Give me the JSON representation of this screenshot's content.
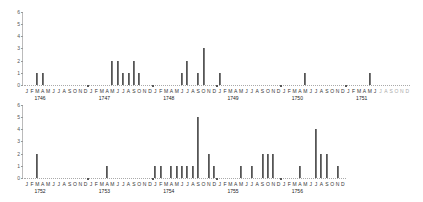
{
  "chart_data": [
    {
      "type": "bar",
      "title": "",
      "xlabel": "",
      "ylabel": "",
      "ylim": [
        0,
        6
      ],
      "yticks": [
        0,
        1,
        2,
        3,
        4,
        5,
        6
      ],
      "grid": false,
      "legend": null,
      "month_labels": [
        "J",
        "F",
        "M",
        "A",
        "M",
        "J",
        "J",
        "A",
        "S",
        "O",
        "N",
        "D"
      ],
      "years": [
        "1746",
        "1747",
        "1748",
        "1749",
        "1750",
        "1751"
      ],
      "series": [
        {
          "name": "counts",
          "values": [
            {
              "year": "1746",
              "month": "Mar",
              "value": 1
            },
            {
              "year": "1746",
              "month": "Apr",
              "value": 1
            },
            {
              "year": "1747",
              "month": "May",
              "value": 2
            },
            {
              "year": "1747",
              "month": "Jun",
              "value": 2
            },
            {
              "year": "1747",
              "month": "Jul",
              "value": 1
            },
            {
              "year": "1747",
              "month": "Aug",
              "value": 1
            },
            {
              "year": "1747",
              "month": "Sep",
              "value": 2
            },
            {
              "year": "1747",
              "month": "Oct",
              "value": 1
            },
            {
              "year": "1748",
              "month": "Jun",
              "value": 1
            },
            {
              "year": "1748",
              "month": "Jul",
              "value": 2
            },
            {
              "year": "1748",
              "month": "Sep",
              "value": 1
            },
            {
              "year": "1748",
              "month": "Oct",
              "value": 3
            },
            {
              "year": "1749",
              "month": "Jan",
              "value": 1
            },
            {
              "year": "1750",
              "month": "May",
              "value": 1
            },
            {
              "year": "1751",
              "month": "May",
              "value": 1
            }
          ]
        }
      ]
    },
    {
      "type": "bar",
      "title": "",
      "xlabel": "",
      "ylabel": "",
      "ylim": [
        0,
        6
      ],
      "yticks": [
        0,
        1,
        2,
        3,
        4,
        5,
        6
      ],
      "grid": false,
      "legend": null,
      "month_labels": [
        "J",
        "F",
        "M",
        "A",
        "M",
        "J",
        "J",
        "A",
        "S",
        "O",
        "N",
        "D"
      ],
      "years": [
        "1752",
        "1753",
        "1754",
        "1755",
        "1756"
      ],
      "series": [
        {
          "name": "counts",
          "values": [
            {
              "year": "1752",
              "month": "Mar",
              "value": 2
            },
            {
              "year": "1753",
              "month": "Apr",
              "value": 1
            },
            {
              "year": "1754",
              "month": "Jan",
              "value": 1
            },
            {
              "year": "1754",
              "month": "Feb",
              "value": 1
            },
            {
              "year": "1754",
              "month": "Apr",
              "value": 1
            },
            {
              "year": "1754",
              "month": "May",
              "value": 1
            },
            {
              "year": "1754",
              "month": "Jun",
              "value": 1
            },
            {
              "year": "1754",
              "month": "Jul",
              "value": 1
            },
            {
              "year": "1754",
              "month": "Aug",
              "value": 1
            },
            {
              "year": "1754",
              "month": "Sep",
              "value": 5
            },
            {
              "year": "1754",
              "month": "Nov",
              "value": 2
            },
            {
              "year": "1754",
              "month": "Dec",
              "value": 1
            },
            {
              "year": "1755",
              "month": "May",
              "value": 1
            },
            {
              "year": "1755",
              "month": "Jul",
              "value": 1
            },
            {
              "year": "1755",
              "month": "Sep",
              "value": 2
            },
            {
              "year": "1755",
              "month": "Oct",
              "value": 2
            },
            {
              "year": "1755",
              "month": "Nov",
              "value": 2
            },
            {
              "year": "1756",
              "month": "Apr",
              "value": 1
            },
            {
              "year": "1756",
              "month": "Jul",
              "value": 4
            },
            {
              "year": "1756",
              "month": "Aug",
              "value": 2
            },
            {
              "year": "1756",
              "month": "Sep",
              "value": 2
            },
            {
              "year": "1756",
              "month": "Nov",
              "value": 1
            }
          ]
        }
      ]
    }
  ],
  "colors": {
    "bar": "#7a7a7a",
    "bar_edge": "#555555",
    "axis": "#bbbbbb",
    "text": "#333333"
  }
}
